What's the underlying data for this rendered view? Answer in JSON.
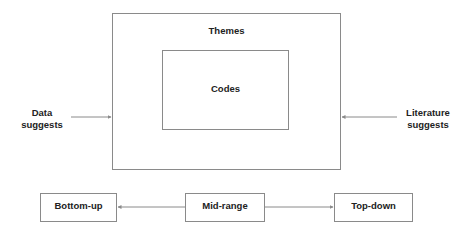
{
  "diagram": {
    "outer_box": {
      "label": "Themes"
    },
    "inner_box": {
      "label": "Codes"
    },
    "left_input": {
      "line1": "Data",
      "line2": "suggests"
    },
    "right_input": {
      "line1": "Literature",
      "line2": "suggests"
    },
    "spectrum": {
      "left": "Bottom-up",
      "center": "Mid-range",
      "right": "Top-down"
    }
  },
  "colors": {
    "line": "#8a8a8a",
    "text": "#222222",
    "background": "#ffffff"
  }
}
